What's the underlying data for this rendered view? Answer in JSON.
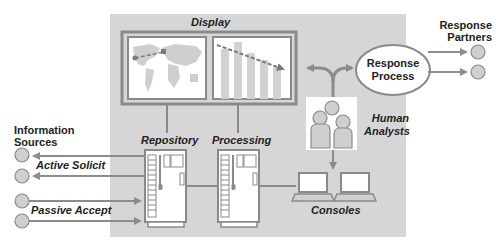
{
  "labels": {
    "display": "Display",
    "repository": "Repository",
    "processing": "Processing",
    "consoles": "Consoles",
    "human_analysts_1": "Human",
    "human_analysts_2": "Analysts",
    "response_process_1": "Response",
    "response_process_2": "Process",
    "response_partners_1": "Response",
    "response_partners_2": "Partners",
    "information_sources_1": "Information",
    "information_sources_2": "Sources",
    "active_solicit": "Active Solicit",
    "passive_accept": "Passive Accept"
  },
  "colors": {
    "panel": "#d6d6d6",
    "frame": "#8a8a8a",
    "arrow": "#8c8c8c",
    "node": "#cfcfcf",
    "text": "#222222"
  }
}
